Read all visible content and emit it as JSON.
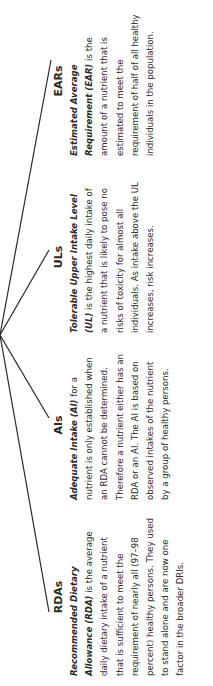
{
  "diagram": {
    "hub": "DRIs",
    "branches": [
      {
        "heading": "RDAs",
        "term": "Recommended Dietary Allowance (RDA)",
        "body": " is the average daily dietary intake of a nutrient that is sufficient to meet the requirement of nearly all (97–98 percent) healthy persons. They used to stand alone and are now one factor in the broader DRIs."
      },
      {
        "heading": "AIs",
        "term": "Adequate Intake (AI)",
        "body": " for a nutrient is only established when an RDA cannot be determined. Therefore a nutrient either has an RDA or an AI. The AI is based on observed intakes of the nutrient by a group of healthy persons."
      },
      {
        "heading": "ULs",
        "term": "Tolerable Upper Intake Level (UL)",
        "body": " is the highest daily intake of a nutrient that is likely to pose no risks of toxicity for almost all individuals. As intake above the UL increases, risk increases."
      },
      {
        "heading": "EARs",
        "term": "Estimated Average Requirement (EAR)",
        "body": " is the amount of a nutrient that is estimated to meet the requirement of half of all healthy individuals in the population."
      }
    ]
  }
}
